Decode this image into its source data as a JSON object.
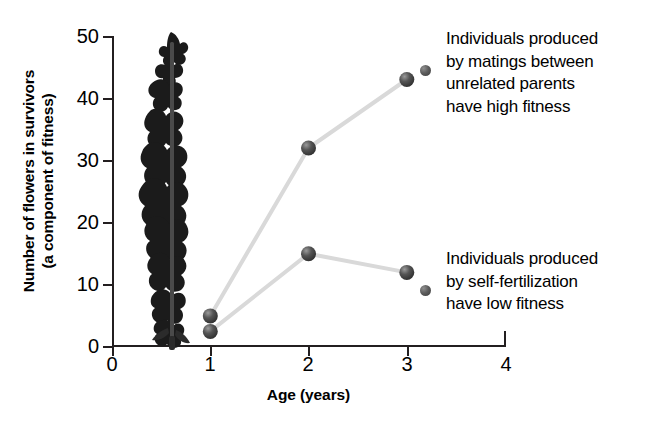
{
  "chart_data": {
    "type": "line",
    "title": "",
    "xlabel": "Age (years)",
    "ylabel": "Number of flowers in survivors\n(a component of fitness)",
    "ylabel_line1": "Number of flowers in survivors",
    "ylabel_line2": "(a component of fitness)",
    "x": [
      1,
      2,
      3
    ],
    "xlim": [
      0,
      4
    ],
    "ylim": [
      0,
      50
    ],
    "xticks": [
      "0",
      "1",
      "2",
      "3",
      "4"
    ],
    "yticks": [
      "0",
      "10",
      "20",
      "30",
      "40",
      "50"
    ],
    "grid": false,
    "legend_position": "right-annotations",
    "series": [
      {
        "name": "Individuals produced by matings between unrelated parents have high fitness",
        "short_name": "outcrossed",
        "values": [
          5,
          32,
          43
        ],
        "marker_color": "#3f3f3f",
        "line_color": "#d9d9d9"
      },
      {
        "name": "Individuals produced by self-fertilization have low fitness",
        "short_name": "selfed",
        "values": [
          2.5,
          15,
          12
        ],
        "marker_color": "#3f3f3f",
        "line_color": "#d9d9d9"
      }
    ],
    "annotations": [
      {
        "id": "outcrossed-note",
        "text": "Individuals produced\nby matings between\nunrelated parents\nhave high fitness"
      },
      {
        "id": "selfed-note",
        "text": "Individuals produced\nby self-fertilization\nhave low fitness"
      }
    ],
    "image_overlay": {
      "name": "flowering-plant-photo",
      "description": "dark silhouette photograph of a tall flowering plant inflorescence"
    },
    "colors": {
      "axis": "#231f20",
      "marker": "#3f3f3f",
      "line": "#d9d9d9",
      "text": "#000000",
      "background": "#ffffff"
    }
  }
}
